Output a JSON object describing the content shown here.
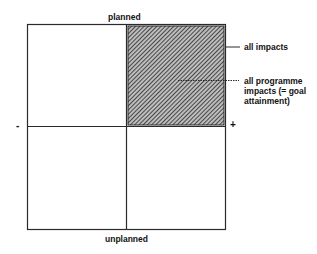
{
  "axes": {
    "top_label": "planned",
    "bottom_label": "unplanned",
    "left_sign": "-",
    "right_sign": "+"
  },
  "annotations": {
    "all_impacts": "all impacts",
    "programme_impacts_lines": [
      "all programme",
      "impacts (= goal",
      "attainment)"
    ]
  },
  "colors": {
    "line": "#2a2a2a",
    "hatch_dark": "#3a3a3a",
    "hatch_light": "#bdbdbd"
  }
}
